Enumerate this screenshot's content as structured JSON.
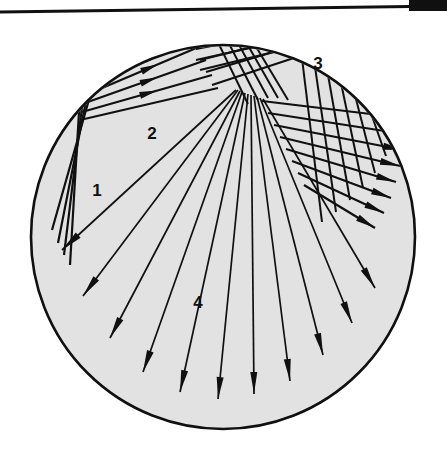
{
  "figure": {
    "kind": "ray-trace-diagram",
    "width": 447,
    "height": 455,
    "background_color": "#ffffff",
    "ink_color": "#101010",
    "disc": {
      "name": "circular-domain",
      "center_x": 223,
      "center_y": 237,
      "radius": 192,
      "fill_color": "#e2e2e2",
      "stroke_color": "#101010",
      "stroke_width": 2.6
    },
    "rules": [
      {
        "name": "top-rule",
        "x1": 0,
        "y1": 12,
        "x2": 447,
        "y2": 6,
        "stroke_width": 3.2,
        "color": "#101010"
      },
      {
        "name": "corner-bar",
        "x": 409,
        "y": 0,
        "width": 38,
        "height": 11,
        "color": "#101010"
      }
    ],
    "labels": [
      {
        "name": "region-label-1",
        "text": "1",
        "x": 97,
        "y": 196,
        "font_size": 17
      },
      {
        "name": "region-label-2",
        "text": "2",
        "x": 152,
        "y": 139,
        "font_size": 17
      },
      {
        "name": "region-label-3",
        "text": "3",
        "x": 318,
        "y": 69,
        "font_size": 17
      },
      {
        "name": "region-label-4",
        "text": "4",
        "x": 198,
        "y": 308,
        "font_size": 17
      }
    ],
    "ray_groups": [
      {
        "name": "group-1-upper-left-incoming",
        "description": "Family of parallel rays entering at upper-left, striking the boundary and turning down-left",
        "stroke_width": 2.2,
        "arrow_length": 17,
        "arrow_width": 6.5,
        "rays": [
          {
            "pts": [
              [
                132,
                30
              ],
              [
                90,
                96
              ],
              [
                52,
                230
              ]
            ],
            "arrow": false
          },
          {
            "pts": [
              [
                120,
                34
              ],
              [
                86,
                101
              ],
              [
                58,
                243
              ]
            ],
            "arrow": false
          },
          {
            "pts": [
              [
                109,
                41
              ],
              [
                82,
                107
              ],
              [
                64,
                255
              ]
            ],
            "arrow": false
          },
          {
            "pts": [
              [
                100,
                50
              ],
              [
                79,
                112
              ],
              [
                70,
                265
              ]
            ],
            "arrow": false
          }
        ]
      },
      {
        "name": "group-2-reflected-upper-left",
        "description": "Rays reflected from upper-left vertex toward upper right, with arrowheads",
        "stroke_width": 2.2,
        "arrow_length": 18,
        "arrow_width": 7,
        "rays": [
          {
            "pts": [
              [
                88,
                94
              ],
              [
                201,
                46
              ]
            ],
            "arrow": true,
            "arrow_at": 0.62
          },
          {
            "pts": [
              [
                85,
                103
              ],
              [
                206,
                60
              ]
            ],
            "arrow": true,
            "arrow_at": 0.6
          },
          {
            "pts": [
              [
                82,
                112
              ],
              [
                212,
                75
              ]
            ],
            "arrow": true,
            "arrow_at": 0.58
          },
          {
            "pts": [
              [
                80,
                120
              ],
              [
                218,
                88
              ]
            ],
            "arrow": false
          }
        ]
      },
      {
        "name": "group-3-upper-right-crossing",
        "description": "Parallel rays crossing the top region toward the right boundary",
        "stroke_width": 2.2,
        "arrow_length": 17,
        "arrow_width": 6.5,
        "rays": [
          {
            "pts": [
              [
                196,
                49
              ],
              [
                276,
                33
              ]
            ],
            "arrow": false
          },
          {
            "pts": [
              [
                200,
                60
              ],
              [
                288,
                38
              ]
            ],
            "arrow": false
          },
          {
            "pts": [
              [
                206,
                72
              ],
              [
                300,
                44
              ]
            ],
            "arrow": false
          },
          {
            "pts": [
              [
                212,
                85
              ],
              [
                312,
                52
              ]
            ],
            "arrow": false
          }
        ]
      },
      {
        "name": "group-4-fan-downward",
        "description": "Long fan of rays radiating from the upper focal zone down through the disc, each ending in a solid arrowhead",
        "stroke_width": 1.7,
        "arrow_length": 22,
        "arrow_width": 7,
        "rays": [
          {
            "pts": [
              [
                236,
                90
              ],
              [
                62,
                250
              ]
            ],
            "arrow": true
          },
          {
            "pts": [
              [
                238,
                90
              ],
              [
                83,
                296
              ]
            ],
            "arrow": true
          },
          {
            "pts": [
              [
                240,
                91
              ],
              [
                110,
                338
              ]
            ],
            "arrow": true
          },
          {
            "pts": [
              [
                242,
                92
              ],
              [
                143,
                372
              ]
            ],
            "arrow": true
          },
          {
            "pts": [
              [
                245,
                93
              ],
              [
                180,
                392
              ]
            ],
            "arrow": true
          },
          {
            "pts": [
              [
                248,
                94
              ],
              [
                218,
                399
              ]
            ],
            "arrow": true
          },
          {
            "pts": [
              [
                251,
                95
              ],
              [
                254,
                394
              ]
            ],
            "arrow": true
          },
          {
            "pts": [
              [
                254,
                96
              ],
              [
                290,
                381
              ]
            ],
            "arrow": true
          },
          {
            "pts": [
              [
                257,
                97
              ],
              [
                323,
                355
              ]
            ],
            "arrow": true
          },
          {
            "pts": [
              [
                260,
                98
              ],
              [
                352,
                323
              ]
            ],
            "arrow": true
          },
          {
            "pts": [
              [
                263,
                99
              ],
              [
                375,
                288
              ]
            ],
            "arrow": true
          }
        ]
      },
      {
        "name": "group-5-right-boundary-arrows",
        "description": "Short slanted rays crossing the vertical family and terminating as right-pointing arrowheads at the right rim",
        "stroke_width": 2.2,
        "arrow_length": 20,
        "arrow_width": 7,
        "rays": [
          {
            "pts": [
              [
                262,
                101
              ],
              [
                404,
                118
              ]
            ],
            "arrow": true
          },
          {
            "pts": [
              [
                268,
                113
              ],
              [
                404,
                134
              ]
            ],
            "arrow": true
          },
          {
            "pts": [
              [
                274,
                125
              ],
              [
                403,
                150
              ]
            ],
            "arrow": true
          },
          {
            "pts": [
              [
                280,
                137
              ],
              [
                400,
                166
              ]
            ],
            "arrow": true
          },
          {
            "pts": [
              [
                286,
                149
              ],
              [
                396,
                182
              ]
            ],
            "arrow": true
          },
          {
            "pts": [
              [
                292,
                161
              ],
              [
                391,
                198
              ]
            ],
            "arrow": true
          },
          {
            "pts": [
              [
                298,
                173
              ],
              [
                384,
                213
              ]
            ],
            "arrow": true
          },
          {
            "pts": [
              [
                304,
                185
              ],
              [
                375,
                228
              ]
            ],
            "arrow": true
          }
        ]
      },
      {
        "name": "group-6-near-vertical-family",
        "description": "Near-vertical lines in the right lobe crossing the slanted family to form a lattice",
        "stroke_width": 2.0,
        "arrow_length": 0,
        "arrow_width": 0,
        "rays": [
          {
            "pts": [
              [
                300,
                42
              ],
              [
                322,
                222
              ]
            ],
            "arrow": false
          },
          {
            "pts": [
              [
                312,
                46
              ],
              [
                336,
                212
              ]
            ],
            "arrow": false
          },
          {
            "pts": [
              [
                324,
                52
              ],
              [
                350,
                200
              ]
            ],
            "arrow": false
          },
          {
            "pts": [
              [
                336,
                59
              ],
              [
                363,
                188
              ]
            ],
            "arrow": false
          },
          {
            "pts": [
              [
                348,
                68
              ],
              [
                375,
                173
              ]
            ],
            "arrow": false
          },
          {
            "pts": [
              [
                359,
                79
              ],
              [
                386,
                156
              ]
            ],
            "arrow": false
          },
          {
            "pts": [
              [
                370,
                92
              ],
              [
                396,
                138
              ]
            ],
            "arrow": false
          }
        ]
      },
      {
        "name": "group-7-top-lattice",
        "description": "Small crossing lattice near the top apex where the two upper families overlap",
        "stroke_width": 2.0,
        "arrow_length": 0,
        "arrow_width": 0,
        "rays": [
          {
            "pts": [
              [
                212,
                30
              ],
              [
                248,
                104
              ]
            ],
            "arrow": false
          },
          {
            "pts": [
              [
                222,
                30
              ],
              [
                258,
                100
              ]
            ],
            "arrow": false
          },
          {
            "pts": [
              [
                232,
                32
              ],
              [
                268,
                98
              ]
            ],
            "arrow": false
          },
          {
            "pts": [
              [
                242,
                35
              ],
              [
                278,
                98
              ]
            ],
            "arrow": false
          },
          {
            "pts": [
              [
                252,
                40
              ],
              [
                288,
                100
              ]
            ],
            "arrow": false
          },
          {
            "pts": [
              [
                196,
                60
              ],
              [
                268,
                44
              ]
            ],
            "arrow": false
          },
          {
            "pts": [
              [
                200,
                70
              ],
              [
                282,
                50
              ]
            ],
            "arrow": false
          }
        ]
      }
    ]
  }
}
